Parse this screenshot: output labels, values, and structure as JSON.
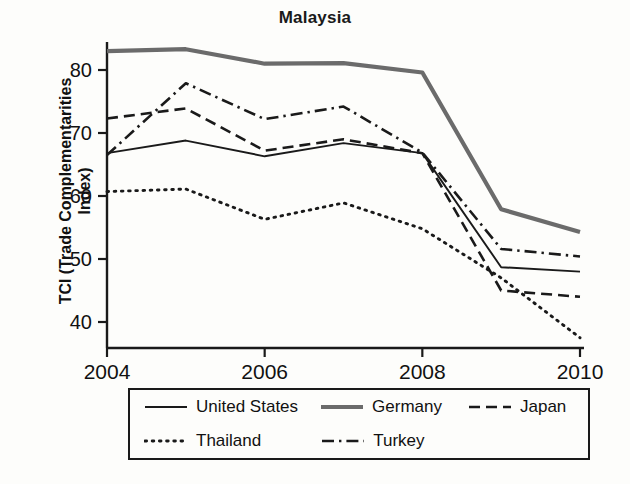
{
  "chart_data": {
    "type": "line",
    "title": "Malaysia",
    "xlabel": "",
    "ylabel": "TCI (Trade Complementarities Index)",
    "x": [
      2004,
      2005,
      2006,
      2007,
      2008,
      2009,
      2010
    ],
    "xticks": [
      2004,
      2006,
      2008,
      2010
    ],
    "xtick_labels": [
      "2004",
      "2006",
      "2008",
      "2010"
    ],
    "yticks": [
      40,
      50,
      60,
      70,
      80
    ],
    "ytick_labels": [
      "40",
      "50",
      "60",
      "70",
      "80"
    ],
    "xlim": [
      2004,
      2010
    ],
    "ylim": [
      35.5,
      84.5
    ],
    "grid": false,
    "legend_position": "below-axes",
    "series": [
      {
        "name": "United States",
        "style": "solid-thin",
        "color": "#1a1a1a",
        "values": [
          66.8,
          68.8,
          66.3,
          68.4,
          66.8,
          48.7,
          48.0
        ]
      },
      {
        "name": "Germany",
        "style": "solid-thick",
        "color": "#6b6b6b",
        "values": [
          83.0,
          83.3,
          81.0,
          81.1,
          79.6,
          57.9,
          54.3
        ]
      },
      {
        "name": "Japan",
        "style": "dashed",
        "color": "#1a1a1a",
        "values": [
          72.3,
          73.9,
          67.2,
          69.0,
          66.8,
          45.0,
          44.0
        ]
      },
      {
        "name": "Thailand",
        "style": "dotted",
        "color": "#1a1a1a",
        "values": [
          60.7,
          61.1,
          56.3,
          58.9,
          54.8,
          47.0,
          37.5
        ]
      },
      {
        "name": "Turkey",
        "style": "dash-dot",
        "color": "#1a1a1a",
        "values": [
          66.5,
          77.9,
          72.2,
          74.2,
          66.9,
          51.6,
          50.4
        ]
      }
    ]
  },
  "legend": {
    "rows": [
      [
        "United States",
        "Germany",
        "Japan"
      ],
      [
        "Thailand",
        "Turkey"
      ]
    ]
  }
}
